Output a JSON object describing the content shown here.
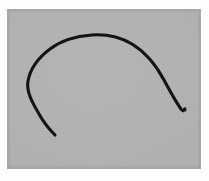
{
  "image": {
    "title": "Hand-drawn arc sketch",
    "width": 209,
    "height": 181,
    "alt_text": "A single black hand-drawn open curved line forming an incomplete arch on a flat gray background"
  },
  "paper": {
    "margin_color": "#fdfdfd",
    "margin_left": 8,
    "margin_top": 10,
    "margin_right": 9,
    "margin_bottom": 13
  },
  "canvas": {
    "name": "drawing-canvas",
    "background_color": "#b2b2b2",
    "border_color": "#a9a9a9",
    "width": 192,
    "height": 158,
    "texture": "scan-noise"
  },
  "drawing": {
    "stroke_count": 1,
    "ink_color": "#141414",
    "stroke_width": 3.1,
    "stroke_linecap": "round",
    "shape_description": "open arch / inverted U with unequal tails",
    "strokes": [
      {
        "name": "arc-stroke",
        "path": "M 47 125 C 42 120, 36 113, 31 104 C 26 95, 18 83, 20 71 C 22 60, 30 48, 42 39 C 55 29, 70 26, 84 25 C 99 24, 112 27, 124 34 C 137 42, 148 55, 156 70 C 163 83, 168 92, 173 99 C 176 104, 177 96, 177 100",
        "start_point": [
          47,
          125
        ],
        "end_point": [
          177,
          100
        ]
      }
    ]
  },
  "chart_data": {
    "type": "line",
    "xlabel": "",
    "ylabel": "",
    "xlim": [
      0,
      192
    ],
    "ylim": [
      0,
      158
    ],
    "grid": false,
    "legend": "none",
    "series": [
      {
        "name": "arc-stroke",
        "x": [
          47,
          41,
          35,
          30,
          26,
          21,
          19,
          19,
          22,
          27,
          34,
          43,
          53,
          64,
          76,
          88,
          100,
          112,
          123,
          133,
          143,
          151,
          158,
          164,
          169,
          173,
          176,
          177
        ],
        "y": [
          125,
          120,
          113,
          105,
          97,
          88,
          80,
          72,
          63,
          54,
          46,
          39,
          33,
          28,
          26,
          25,
          25,
          28,
          33,
          40,
          48,
          57,
          66,
          75,
          84,
          92,
          98,
          100
        ]
      }
    ]
  }
}
